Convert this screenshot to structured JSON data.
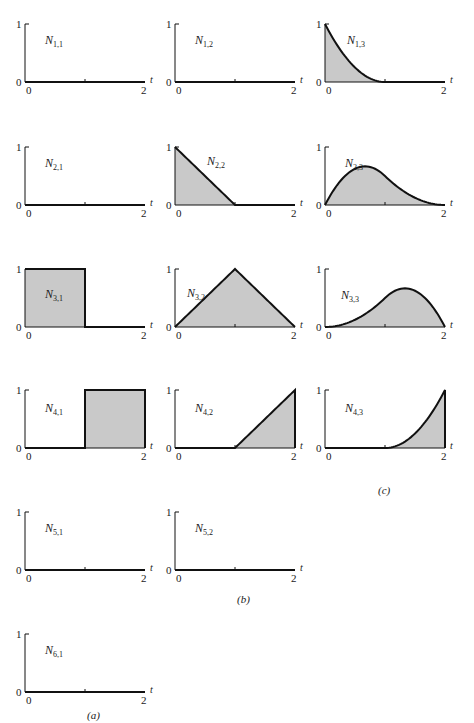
{
  "figure": {
    "captions": [
      {
        "id": "c",
        "text": "(c)",
        "x": 378,
        "y": 494
      },
      {
        "id": "b",
        "text": "(b)",
        "x": 237,
        "y": 603
      },
      {
        "id": "a",
        "text": "(a)",
        "x": 87,
        "y": 719
      }
    ],
    "axis_labels": {
      "y_top": "1",
      "y_bottom": "0",
      "x_left": "0",
      "x_right": "2",
      "x_var": "t"
    },
    "colors": {
      "fill": "#c9c9c9",
      "stroke": "#111111",
      "axis": "#111111",
      "background": "#ffffff"
    }
  },
  "chart_data": [
    {
      "type": "area",
      "title": "N1,1",
      "fn": "N",
      "sub": "1,1",
      "col": 0,
      "row": 0,
      "x": [
        0,
        2
      ],
      "y": [
        0,
        0
      ],
      "xlim": [
        0,
        2
      ],
      "ylim": [
        0,
        1
      ],
      "kind": "zero"
    },
    {
      "type": "area",
      "title": "N1,2",
      "fn": "N",
      "sub": "1,2",
      "col": 1,
      "row": 0,
      "x": [
        0,
        2
      ],
      "y": [
        0,
        0
      ],
      "xlim": [
        0,
        2
      ],
      "ylim": [
        0,
        1
      ],
      "kind": "zero"
    },
    {
      "type": "area",
      "title": "N1,3",
      "fn": "N",
      "sub": "1,3",
      "col": 2,
      "row": 0,
      "x": [
        0,
        0.25,
        0.5,
        0.75,
        1,
        2
      ],
      "y": [
        1,
        0.5625,
        0.25,
        0.0625,
        0,
        0
      ],
      "xlim": [
        0,
        2
      ],
      "ylim": [
        0,
        1
      ],
      "kind": "quad_down"
    },
    {
      "type": "area",
      "title": "N2,1",
      "fn": "N",
      "sub": "2,1",
      "col": 0,
      "row": 1,
      "x": [
        0,
        2
      ],
      "y": [
        0,
        0
      ],
      "xlim": [
        0,
        2
      ],
      "ylim": [
        0,
        1
      ],
      "kind": "zero"
    },
    {
      "type": "area",
      "title": "N2,2",
      "fn": "N",
      "sub": "2,2",
      "col": 1,
      "row": 1,
      "x": [
        0,
        1,
        2
      ],
      "y": [
        1,
        0,
        0
      ],
      "xlim": [
        0,
        2
      ],
      "ylim": [
        0,
        1
      ],
      "kind": "ramp_down"
    },
    {
      "type": "area",
      "title": "N2,3",
      "fn": "N",
      "sub": "2,3",
      "col": 2,
      "row": 1,
      "x": [
        0,
        0.5,
        0.67,
        1,
        1.5,
        2
      ],
      "y": [
        0,
        0.625,
        0.667,
        0.5,
        0.125,
        0
      ],
      "xlim": [
        0,
        2
      ],
      "ylim": [
        0,
        1
      ],
      "kind": "bump_left"
    },
    {
      "type": "area",
      "title": "N3,1",
      "fn": "N",
      "sub": "3,1",
      "col": 0,
      "row": 2,
      "x": [
        0,
        1,
        1,
        2
      ],
      "y": [
        1,
        1,
        0,
        0
      ],
      "xlim": [
        0,
        2
      ],
      "ylim": [
        0,
        1
      ],
      "kind": "box_left"
    },
    {
      "type": "area",
      "title": "N3,2",
      "fn": "N",
      "sub": "3,2",
      "col": 1,
      "row": 2,
      "x": [
        0,
        1,
        2
      ],
      "y": [
        0,
        1,
        0
      ],
      "xlim": [
        0,
        2
      ],
      "ylim": [
        0,
        1
      ],
      "kind": "hat"
    },
    {
      "type": "area",
      "title": "N3,3",
      "fn": "N",
      "sub": "3,3",
      "col": 2,
      "row": 2,
      "x": [
        0,
        0.5,
        1,
        1.33,
        1.5,
        2
      ],
      "y": [
        0,
        0.125,
        0.5,
        0.667,
        0.625,
        0
      ],
      "xlim": [
        0,
        2
      ],
      "ylim": [
        0,
        1
      ],
      "kind": "bump_right"
    },
    {
      "type": "area",
      "title": "N4,1",
      "fn": "N",
      "sub": "4,1",
      "col": 0,
      "row": 3,
      "x": [
        0,
        1,
        1,
        2
      ],
      "y": [
        0,
        0,
        1,
        1
      ],
      "xlim": [
        0,
        2
      ],
      "ylim": [
        0,
        1
      ],
      "kind": "box_right"
    },
    {
      "type": "area",
      "title": "N4,2",
      "fn": "N",
      "sub": "4,2",
      "col": 1,
      "row": 3,
      "x": [
        0,
        1,
        2
      ],
      "y": [
        0,
        0,
        1
      ],
      "xlim": [
        0,
        2
      ],
      "ylim": [
        0,
        1
      ],
      "kind": "ramp_up"
    },
    {
      "type": "area",
      "title": "N4,3",
      "fn": "N",
      "sub": "4,3",
      "col": 2,
      "row": 3,
      "x": [
        0,
        1,
        1.25,
        1.5,
        1.75,
        2
      ],
      "y": [
        0,
        0,
        0.0625,
        0.25,
        0.5625,
        1
      ],
      "xlim": [
        0,
        2
      ],
      "ylim": [
        0,
        1
      ],
      "kind": "quad_up"
    },
    {
      "type": "area",
      "title": "N5,1",
      "fn": "N",
      "sub": "5,1",
      "col": 0,
      "row": 4,
      "x": [
        0,
        2
      ],
      "y": [
        0,
        0
      ],
      "xlim": [
        0,
        2
      ],
      "ylim": [
        0,
        1
      ],
      "kind": "zero"
    },
    {
      "type": "area",
      "title": "N5,2",
      "fn": "N",
      "sub": "5,2",
      "col": 1,
      "row": 4,
      "x": [
        0,
        2
      ],
      "y": [
        0,
        0
      ],
      "xlim": [
        0,
        2
      ],
      "ylim": [
        0,
        1
      ],
      "kind": "zero"
    },
    {
      "type": "area",
      "title": "N6,1",
      "fn": "N",
      "sub": "6,1",
      "col": 0,
      "row": 5,
      "x": [
        0,
        2
      ],
      "y": [
        0,
        0
      ],
      "xlim": [
        0,
        2
      ],
      "ylim": [
        0,
        1
      ],
      "kind": "zero"
    }
  ]
}
